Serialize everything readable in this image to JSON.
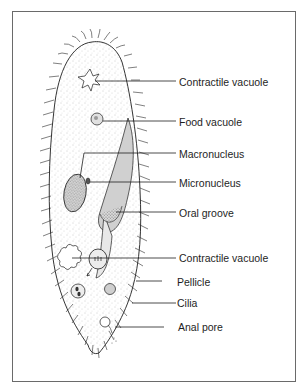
{
  "diagram": {
    "labels": [
      {
        "id": "contractile-vacuole-top",
        "text": "Contractile vacuole"
      },
      {
        "id": "food-vacuole",
        "text": "Food vacuole"
      },
      {
        "id": "macronucleus",
        "text": "Macronucleus"
      },
      {
        "id": "micronucleus",
        "text": "Micronucleus"
      },
      {
        "id": "oral-groove",
        "text": "Oral groove"
      },
      {
        "id": "contractile-vacuole-bottom",
        "text": "Contractile vacuole"
      },
      {
        "id": "pellicle",
        "text": "Pellicle"
      },
      {
        "id": "cilia",
        "text": "Cilia"
      },
      {
        "id": "anal-pore",
        "text": "Anal pore"
      }
    ],
    "colors": {
      "line": "#1e1e1e",
      "border": "#6a6a6a",
      "stipple": "#9a9a9a"
    }
  }
}
